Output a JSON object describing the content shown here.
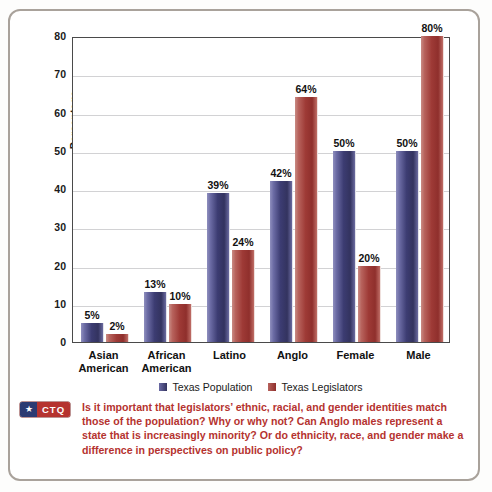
{
  "chart_data": {
    "type": "bar",
    "title": "",
    "xlabel": "",
    "ylabel": "Percentage",
    "ylim": [
      0,
      80
    ],
    "ytick_step": 10,
    "yticks": [
      "80",
      "70",
      "60",
      "50",
      "40",
      "30",
      "20",
      "10",
      "0"
    ],
    "grid": true,
    "legend_position": "bottom",
    "categories": [
      "Asian American",
      "African American",
      "Latino",
      "Anglo",
      "Female",
      "Male"
    ],
    "category_lines": [
      [
        "Asian",
        "American"
      ],
      [
        "African",
        "American"
      ],
      [
        "Latino",
        ""
      ],
      [
        "Anglo",
        ""
      ],
      [
        "Female",
        ""
      ],
      [
        "Male",
        ""
      ]
    ],
    "series": [
      {
        "name": "Texas Population",
        "color": "#3c3c72",
        "values": [
          5,
          13,
          39,
          42,
          50,
          50
        ],
        "labels": [
          "5%",
          "13%",
          "39%",
          "42%",
          "50%",
          "50%"
        ]
      },
      {
        "name": "Texas Legislators",
        "color": "#9e3a36",
        "values": [
          2,
          10,
          24,
          64,
          20,
          80
        ],
        "labels": [
          "2%",
          "10%",
          "24%",
          "64%",
          "20%",
          "80%"
        ]
      }
    ]
  },
  "legend": {
    "items": [
      {
        "label": "Texas Population"
      },
      {
        "label": "Texas Legislators"
      }
    ]
  },
  "caption": {
    "badge_star": "★",
    "badge_label": "CTQ",
    "text": "Is it important that legislators’ ethnic, racial, and gender identities match those of the population? Why or why not? Can Anglo males represent a state that is increasingly minority? Or do ethnicity, race, and gender make a difference in perspectives on public policy?"
  },
  "colors": {
    "population_bar": "#3c3c72",
    "legislators_bar": "#9e3a36",
    "caption_text": "#b5332f",
    "badge_red": "#b5332f",
    "badge_blue": "#2b3a72",
    "frame_border": "#a9a29b",
    "gridline": "#d2d2d4"
  }
}
